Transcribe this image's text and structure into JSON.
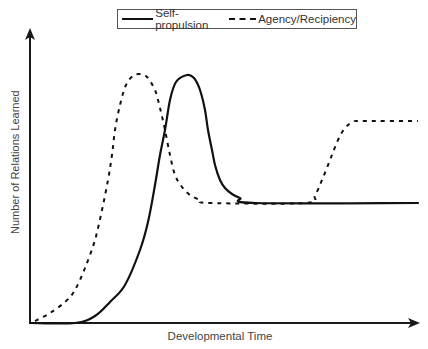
{
  "chart_data": {
    "type": "line",
    "title": "",
    "xlabel": "Developmental Time",
    "ylabel": "Number of Relations Learned",
    "axis_ticks": "none",
    "grid": false,
    "legend_position": "top",
    "legend": [
      "Self-propulsion",
      "Agency/Recipiency"
    ],
    "series": [
      {
        "name": "Self-propulsion",
        "style": "solid",
        "points_px": [
          [
            30,
            323
          ],
          [
            75,
            323
          ],
          [
            95,
            316
          ],
          [
            110,
            302
          ],
          [
            125,
            285
          ],
          [
            140,
            250
          ],
          [
            148,
            222
          ],
          [
            155,
            185
          ],
          [
            160,
            155
          ],
          [
            165,
            130
          ],
          [
            170,
            100
          ],
          [
            176,
            82
          ],
          [
            187,
            75
          ],
          [
            194,
            78
          ],
          [
            200,
            90
          ],
          [
            205,
            110
          ],
          [
            208,
            130
          ],
          [
            212,
            150
          ],
          [
            215,
            165
          ],
          [
            220,
            180
          ],
          [
            225,
            188
          ],
          [
            232,
            194
          ],
          [
            240,
            198
          ],
          [
            255,
            203
          ],
          [
            418,
            203
          ]
        ]
      },
      {
        "name": "Agency/Recipiency",
        "style": "dashed",
        "points_px": [
          [
            35,
            321
          ],
          [
            50,
            313
          ],
          [
            65,
            302
          ],
          [
            75,
            290
          ],
          [
            85,
            268
          ],
          [
            95,
            240
          ],
          [
            102,
            210
          ],
          [
            108,
            180
          ],
          [
            112,
            155
          ],
          [
            115,
            130
          ],
          [
            120,
            105
          ],
          [
            126,
            85
          ],
          [
            133,
            76
          ],
          [
            140,
            74
          ],
          [
            147,
            77
          ],
          [
            155,
            90
          ],
          [
            160,
            108
          ],
          [
            165,
            130
          ],
          [
            170,
            155
          ],
          [
            175,
            175
          ],
          [
            182,
            187
          ],
          [
            190,
            195
          ],
          [
            200,
            200
          ],
          [
            210,
            203
          ],
          [
            305,
            203
          ],
          [
            315,
            195
          ],
          [
            322,
            180
          ],
          [
            330,
            160
          ],
          [
            338,
            140
          ],
          [
            345,
            128
          ],
          [
            353,
            122
          ],
          [
            362,
            121
          ],
          [
            418,
            121
          ]
        ]
      }
    ],
    "axes_px": {
      "origin": [
        30,
        323
      ],
      "x_end": [
        419,
        323
      ],
      "y_end": [
        30,
        30
      ]
    }
  },
  "legend": {
    "series1": "Self-propulsion",
    "series2": "Agency/Recipiency"
  },
  "axes": {
    "xlabel": "Developmental Time",
    "ylabel": "Number of Relations Learned"
  },
  "colors": {
    "line": "#111111",
    "axis": "#1a1a1a",
    "text": "#444444"
  }
}
